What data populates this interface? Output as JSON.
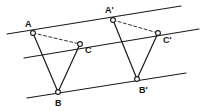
{
  "figure": {
    "background_color": "#ffffff",
    "stroke_color": "#1a1a1a",
    "vertex_fill_color": "#ffffff",
    "width": 209,
    "height": 111
  },
  "parallel_lines": [
    {
      "name": "upper-parallel-line",
      "x1": 7,
      "y1": 34,
      "x2": 181,
      "y2": 6,
      "style": "solid"
    },
    {
      "name": "middle-parallel-line",
      "x1": 24,
      "y1": 58,
      "x2": 199,
      "y2": 29,
      "style": "solid"
    },
    {
      "name": "lower-parallel-line",
      "x1": 27,
      "y1": 98,
      "x2": 186,
      "y2": 73,
      "style": "solid"
    }
  ],
  "vertices": [
    {
      "id": "A",
      "label": "A",
      "x": 33,
      "y": 33,
      "label_x": 25,
      "label_y": 27
    },
    {
      "id": "B",
      "label": "B",
      "x": 58,
      "y": 92,
      "label_x": 55,
      "label_y": 106
    },
    {
      "id": "C",
      "label": "C",
      "x": 80,
      "y": 44,
      "label_x": 85,
      "label_y": 53
    },
    {
      "id": "A'",
      "label": "A'",
      "x": 113,
      "y": 20,
      "label_x": 105,
      "label_y": 13
    },
    {
      "id": "B'",
      "label": "B'",
      "x": 137,
      "y": 79,
      "label_x": 139,
      "label_y": 93
    },
    {
      "id": "C'",
      "label": "C'",
      "x": 158,
      "y": 33,
      "label_x": 163,
      "label_y": 43
    }
  ],
  "segments": [
    {
      "name": "segment-AB",
      "from": "A",
      "to": "B",
      "style": "solid"
    },
    {
      "name": "segment-BC",
      "from": "B",
      "to": "C",
      "style": "solid"
    },
    {
      "name": "segment-AC",
      "from": "A",
      "to": "C",
      "style": "dashed"
    },
    {
      "name": "segment-A'B'",
      "from": "A'",
      "to": "B'",
      "style": "solid"
    },
    {
      "name": "segment-B'C'",
      "from": "B'",
      "to": "C'",
      "style": "solid"
    },
    {
      "name": "segment-A'C'",
      "from": "A'",
      "to": "C'",
      "style": "dashed"
    }
  ]
}
